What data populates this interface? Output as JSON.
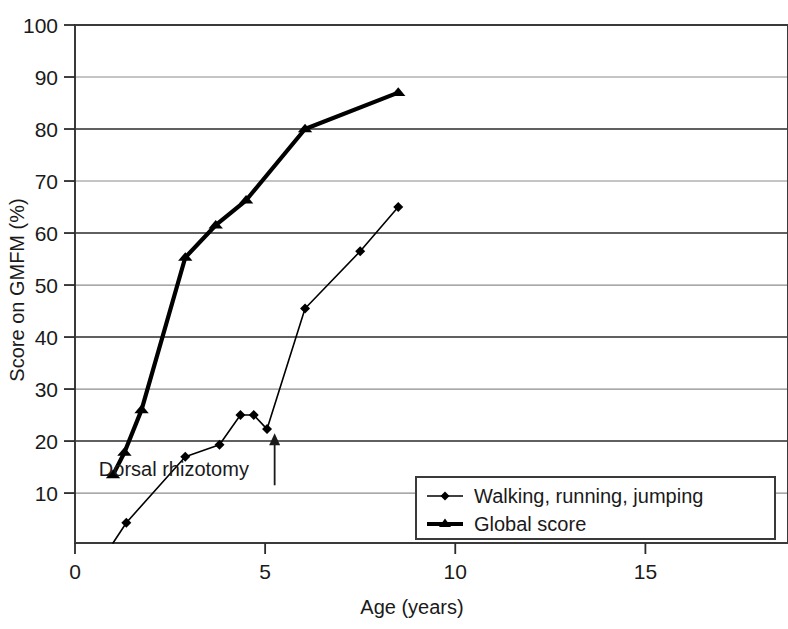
{
  "chart_data": {
    "type": "line",
    "title": "",
    "xlabel": "Age (years)",
    "ylabel": "Score on GMFM (%)",
    "xlim": [
      0,
      18.75
    ],
    "ylim": [
      0.4,
      100
    ],
    "xticks": [
      0,
      5,
      10,
      15
    ],
    "xtick_labels": [
      "0",
      "5",
      "10",
      "15"
    ],
    "yticks": [
      10,
      20,
      30,
      40,
      50,
      60,
      70,
      80,
      90,
      100
    ],
    "ytick_labels": [
      "10",
      "20",
      "30",
      "40",
      "50",
      "60",
      "70",
      "80",
      "90",
      "100"
    ],
    "grid": "horizontal",
    "legend_position": "bottom-right",
    "series": [
      {
        "name": "Walking, running, jumping",
        "marker": "diamond",
        "line_width": "thin",
        "color": "#000000",
        "points": [
          {
            "x": 1.0,
            "y": 0.4
          },
          {
            "x": 1.35,
            "y": 4.3
          },
          {
            "x": 2.9,
            "y": 17.0
          },
          {
            "x": 3.8,
            "y": 19.3
          },
          {
            "x": 4.35,
            "y": 25.0
          },
          {
            "x": 4.7,
            "y": 25.0
          },
          {
            "x": 5.05,
            "y": 22.3
          },
          {
            "x": 6.05,
            "y": 45.5
          },
          {
            "x": 7.5,
            "y": 56.5
          },
          {
            "x": 8.5,
            "y": 65.0
          }
        ]
      },
      {
        "name": "Global score",
        "marker": "triangle",
        "line_width": "thick",
        "color": "#000000",
        "points": [
          {
            "x": 1.0,
            "y": 13.5
          },
          {
            "x": 1.3,
            "y": 17.8
          },
          {
            "x": 1.75,
            "y": 26.0
          },
          {
            "x": 2.9,
            "y": 55.3
          },
          {
            "x": 3.7,
            "y": 61.5
          },
          {
            "x": 4.5,
            "y": 66.3
          },
          {
            "x": 6.05,
            "y": 80.0
          },
          {
            "x": 8.5,
            "y": 87.0
          }
        ]
      }
    ],
    "annotations": [
      {
        "text": "Dorsal rhizotomy",
        "arrow_x": 5.25,
        "arrow_y_from": 11.5,
        "arrow_y_to": 21.5,
        "label_x": 2.6,
        "label_y": 13.2
      }
    ]
  },
  "legend": {
    "items": [
      {
        "label": "Walking, running, jumping",
        "marker": "diamond"
      },
      {
        "label": "Global score",
        "marker": "triangle"
      }
    ]
  }
}
